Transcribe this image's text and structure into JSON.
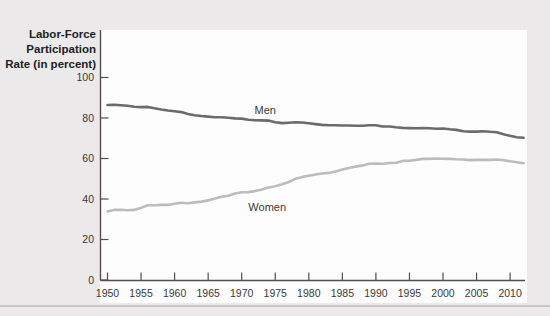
{
  "figure": {
    "y_axis_title_lines": [
      "Labor-Force",
      "Participation",
      "Rate (in percent)"
    ],
    "colors": {
      "background": "#ebe9e9",
      "panel": "#fdfdfd",
      "axis": "#4f4f4f",
      "divider": "#c9c6c5",
      "men_line": "#6b6b6b",
      "women_line": "#bcbcbc"
    }
  },
  "chart_data": {
    "type": "line",
    "title": "",
    "xlabel": "",
    "ylabel": "Labor-Force Participation Rate (in percent)",
    "xlim": [
      1949,
      2012.5
    ],
    "ylim": [
      0,
      103
    ],
    "grid": false,
    "legend_position": "inline-labels",
    "x_ticks": [
      1950,
      1955,
      1960,
      1965,
      1970,
      1975,
      1980,
      1985,
      1990,
      1995,
      2000,
      2005,
      2010
    ],
    "y_ticks": [
      0,
      20,
      40,
      60,
      80,
      100
    ],
    "series": [
      {
        "name": "Men",
        "color": "#6b6b6b",
        "x": [
          1950,
          1951,
          1952,
          1953,
          1954,
          1955,
          1956,
          1957,
          1958,
          1959,
          1960,
          1961,
          1962,
          1963,
          1964,
          1965,
          1966,
          1967,
          1968,
          1969,
          1970,
          1971,
          1972,
          1973,
          1974,
          1975,
          1976,
          1977,
          1978,
          1979,
          1980,
          1981,
          1982,
          1983,
          1984,
          1985,
          1986,
          1987,
          1988,
          1989,
          1990,
          1991,
          1992,
          1993,
          1994,
          1995,
          1996,
          1997,
          1998,
          1999,
          2000,
          2001,
          2002,
          2003,
          2004,
          2005,
          2006,
          2007,
          2008,
          2009,
          2010,
          2011,
          2012
        ],
        "values": [
          86.4,
          86.5,
          86.3,
          86.0,
          85.6,
          85.4,
          85.5,
          84.8,
          84.2,
          83.7,
          83.3,
          82.9,
          82.0,
          81.4,
          81.0,
          80.7,
          80.4,
          80.4,
          80.1,
          79.8,
          79.7,
          79.1,
          78.9,
          78.8,
          78.7,
          77.9,
          77.5,
          77.7,
          77.9,
          77.8,
          77.4,
          77.0,
          76.6,
          76.4,
          76.4,
          76.3,
          76.3,
          76.2,
          76.2,
          76.4,
          76.4,
          75.8,
          75.8,
          75.4,
          75.1,
          75.0,
          74.9,
          75.0,
          74.9,
          74.7,
          74.8,
          74.4,
          74.1,
          73.5,
          73.3,
          73.3,
          73.5,
          73.2,
          73.0,
          72.0,
          71.2,
          70.5,
          70.2
        ]
      },
      {
        "name": "Women",
        "color": "#bcbcbc",
        "x": [
          1950,
          1951,
          1952,
          1953,
          1954,
          1955,
          1956,
          1957,
          1958,
          1959,
          1960,
          1961,
          1962,
          1963,
          1964,
          1965,
          1966,
          1967,
          1968,
          1969,
          1970,
          1971,
          1972,
          1973,
          1974,
          1975,
          1976,
          1977,
          1978,
          1979,
          1980,
          1981,
          1982,
          1983,
          1984,
          1985,
          1986,
          1987,
          1988,
          1989,
          1990,
          1991,
          1992,
          1993,
          1994,
          1995,
          1996,
          1997,
          1998,
          1999,
          2000,
          2001,
          2002,
          2003,
          2004,
          2005,
          2006,
          2007,
          2008,
          2009,
          2010,
          2011,
          2012
        ],
        "values": [
          33.9,
          34.6,
          34.7,
          34.4,
          34.6,
          35.7,
          36.9,
          36.9,
          37.1,
          37.1,
          37.7,
          38.1,
          37.9,
          38.3,
          38.7,
          39.3,
          40.3,
          41.1,
          41.6,
          42.7,
          43.3,
          43.4,
          43.9,
          44.7,
          45.7,
          46.3,
          47.3,
          48.4,
          50.0,
          50.9,
          51.5,
          52.1,
          52.6,
          52.9,
          53.6,
          54.5,
          55.3,
          56.0,
          56.6,
          57.4,
          57.5,
          57.4,
          57.8,
          57.9,
          58.8,
          58.9,
          59.3,
          59.8,
          59.8,
          60.0,
          59.9,
          59.8,
          59.6,
          59.5,
          59.2,
          59.3,
          59.4,
          59.3,
          59.5,
          59.2,
          58.6,
          58.1,
          57.7
        ]
      }
    ],
    "annotations": [
      {
        "text": "Men",
        "x": 1973.5,
        "y": 81.8
      },
      {
        "text": "Women",
        "x": 1973.8,
        "y": 34.3
      }
    ]
  }
}
